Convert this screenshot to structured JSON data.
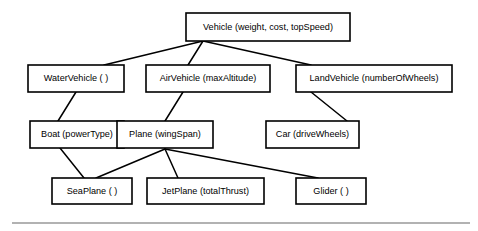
{
  "diagram": {
    "type": "class-hierarchy",
    "background_color": "#ffffff",
    "box_fill_color": "#ffffff",
    "box_border_color": "#000000",
    "edge_color": "#000000",
    "text_color": "#000000",
    "footer_rule_color": "#999999",
    "nodes": [
      {
        "id": "vehicle",
        "label": "Vehicle (weight, cost, topSpeed)",
        "class_name": "Vehicle",
        "attributes": "weight, cost, topSpeed",
        "level": 0,
        "x": 186,
        "y": 13,
        "w": 164,
        "h": 28
      },
      {
        "id": "watervehicle",
        "label": "WaterVehicle ( )",
        "class_name": "WaterVehicle",
        "attributes": "",
        "level": 1,
        "x": 28,
        "y": 65,
        "w": 96,
        "h": 27
      },
      {
        "id": "airvehicle",
        "label": "AirVehicle (maxAltitude)",
        "class_name": "AirVehicle",
        "attributes": "maxAltitude",
        "level": 1,
        "x": 146,
        "y": 65,
        "w": 124,
        "h": 27
      },
      {
        "id": "landvehicle",
        "label": "LandVehicle (numberOfWheels)",
        "class_name": "LandVehicle",
        "attributes": "numberOfWheels",
        "level": 1,
        "x": 296,
        "y": 65,
        "w": 156,
        "h": 27
      },
      {
        "id": "boat",
        "label": "Boat (powerType)",
        "class_name": "Boat",
        "attributes": "powerType",
        "level": 2,
        "x": 30,
        "y": 121,
        "w": 94,
        "h": 27
      },
      {
        "id": "plane",
        "label": "Plane (wingSpan)",
        "class_name": "Plane",
        "attributes": "wingSpan",
        "level": 2,
        "x": 117,
        "y": 121,
        "w": 96,
        "h": 27
      },
      {
        "id": "car",
        "label": "Car (driveWheels)",
        "class_name": "Car",
        "attributes": "driveWheels",
        "level": 2,
        "x": 266,
        "y": 121,
        "w": 93,
        "h": 27
      },
      {
        "id": "seaplane",
        "label": "SeaPlane ( )",
        "class_name": "SeaPlane",
        "attributes": "",
        "level": 3,
        "x": 52,
        "y": 178,
        "w": 80,
        "h": 26
      },
      {
        "id": "jetplane",
        "label": "JetPlane (totalThrust)",
        "class_name": "JetPlane",
        "attributes": "totalThrust",
        "level": 3,
        "x": 147,
        "y": 178,
        "w": 117,
        "h": 26
      },
      {
        "id": "glider",
        "label": "Glider ( )",
        "class_name": "Glider",
        "attributes": "",
        "level": 3,
        "x": 296,
        "y": 178,
        "w": 70,
        "h": 26
      }
    ],
    "edges": [
      {
        "id": "vehicle-watervehicle",
        "from": "vehicle",
        "to": "watervehicle",
        "x1": 203,
        "y1": 41,
        "x2": 104,
        "y2": 65
      },
      {
        "id": "vehicle-airvehicle",
        "from": "vehicle",
        "to": "airvehicle",
        "x1": 203,
        "y1": 41,
        "x2": 188,
        "y2": 65
      },
      {
        "id": "vehicle-landvehicle",
        "from": "vehicle",
        "to": "landvehicle",
        "x1": 203,
        "y1": 41,
        "x2": 311,
        "y2": 65
      },
      {
        "id": "watervehicle-boat",
        "from": "watervehicle",
        "to": "boat",
        "x1": 76,
        "y1": 92,
        "x2": 58,
        "y2": 121
      },
      {
        "id": "airvehicle-plane",
        "from": "airvehicle",
        "to": "plane",
        "x1": 183,
        "y1": 92,
        "x2": 165,
        "y2": 121
      },
      {
        "id": "landvehicle-car",
        "from": "landvehicle",
        "to": "car",
        "x1": 311,
        "y1": 92,
        "x2": 347,
        "y2": 121
      },
      {
        "id": "boat-seaplane",
        "from": "boat",
        "to": "seaplane",
        "x1": 60,
        "y1": 148,
        "x2": 84,
        "y2": 178
      },
      {
        "id": "plane-seaplane",
        "from": "plane",
        "to": "seaplane",
        "x1": 165,
        "y1": 149,
        "x2": 96,
        "y2": 178
      },
      {
        "id": "plane-jetplane",
        "from": "plane",
        "to": "jetplane",
        "x1": 165,
        "y1": 149,
        "x2": 178,
        "y2": 178
      },
      {
        "id": "plane-glider",
        "from": "plane",
        "to": "glider",
        "x1": 165,
        "y1": 149,
        "x2": 318,
        "y2": 178
      }
    ],
    "footer_rule": {
      "x1": 12,
      "y1": 223,
      "x2": 470,
      "y2": 223
    }
  }
}
